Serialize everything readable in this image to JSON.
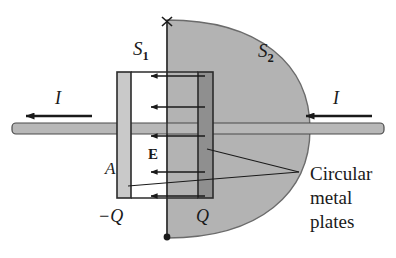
{
  "figure": {
    "type": "physics-diagram",
    "background_color": "#ffffff",
    "ink_color": "#1a1a1a",
    "surface_fill": "#b3b3b3",
    "plate_left_fill": "#c9c9c9",
    "plate_right_fill": "#8f8f8f",
    "wire_fill": "#b8b8b8"
  },
  "labels": {
    "s1": {
      "base": "S",
      "sub": "1"
    },
    "s2": {
      "base": "S",
      "sub": "2"
    },
    "current_left": "I",
    "current_right": "I",
    "field": "E",
    "area": "A",
    "charge_negative": "−Q",
    "charge_positive": "Q",
    "callout": {
      "line1": "Circular",
      "line2": "metal",
      "line3": "plates"
    }
  },
  "elements": {
    "field_arrow_count": 5,
    "field_arrow_direction": "left",
    "current_arrow_direction": "left",
    "s1_marker_top": "x-mark",
    "s1_marker_bottom": "filled-dot",
    "s2_shape": "half-dome-bulge"
  }
}
